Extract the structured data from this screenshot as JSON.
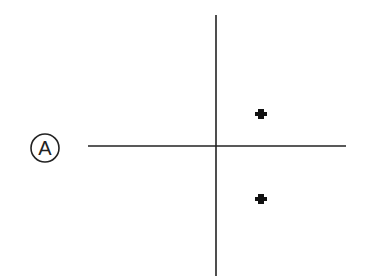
{
  "diagram": {
    "label": "A",
    "stroke_color": "#222222",
    "axes": {
      "vertical": {
        "x": 216,
        "y1": 15,
        "y2": 276
      },
      "horizontal": {
        "y": 146,
        "x1": 88,
        "x2": 346
      }
    },
    "points": [
      {
        "x": 261,
        "y": 113
      },
      {
        "x": 261,
        "y": 198
      }
    ]
  }
}
